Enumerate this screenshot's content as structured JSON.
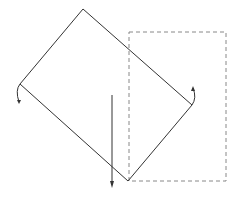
{
  "diagram": {
    "colors": {
      "stroke": "#333333",
      "dashed_stroke": "#888888",
      "background": "#ffffff"
    },
    "elements": [
      {
        "name": "rotated-rectangle",
        "style": "solid"
      },
      {
        "name": "dashed-rectangle",
        "style": "dashed"
      },
      {
        "name": "rotation-arrow-left",
        "direction": "down"
      },
      {
        "name": "rotation-arrow-right",
        "direction": "up"
      },
      {
        "name": "vertical-arrow",
        "direction": "down"
      }
    ]
  }
}
